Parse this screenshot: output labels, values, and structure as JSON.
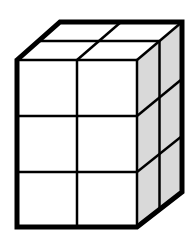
{
  "figure": {
    "dimensions": {
      "width_cubes": 2,
      "depth_cubes": 2,
      "height_cubes": 3
    },
    "total_cubes": 12,
    "colors": {
      "front_face": "#ffffff",
      "top_face": "#ffffff",
      "side_face": "#d9d9d9",
      "edge": "#000000",
      "background": "#ffffff"
    }
  }
}
